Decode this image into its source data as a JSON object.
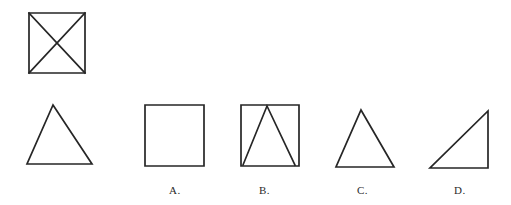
{
  "sheet": {
    "background_color": "#ffffff",
    "ink_color": "#262626",
    "width": 511,
    "height": 205
  },
  "prompt": {
    "figures": [
      {
        "id": "prompt-figure-1",
        "name": "square-with-diagonals",
        "description": "square with both diagonals drawn forming an X",
        "position": {
          "x": 28,
          "y": 12,
          "width": 57,
          "height": 61
        }
      },
      {
        "id": "prompt-figure-2",
        "name": "isosceles-triangle",
        "description": "isosceles triangle, apex at top center",
        "position": {
          "x": 27,
          "y": 105,
          "width": 65,
          "height": 59
        }
      }
    ]
  },
  "options": [
    {
      "key": "A",
      "label": "A.",
      "shape_name": "square",
      "description": "plain square outline",
      "position": {
        "x": 145,
        "y": 105,
        "width": 59,
        "height": 61
      },
      "label_position": {
        "x": 169,
        "y": 185
      }
    },
    {
      "key": "B",
      "label": "B.",
      "shape_name": "square-with-inscribed-triangle",
      "description": "square containing a triangle whose base is the square base and apex at top edge",
      "position": {
        "x": 241,
        "y": 105,
        "width": 58,
        "height": 61
      },
      "label_position": {
        "x": 259,
        "y": 185
      }
    },
    {
      "key": "C",
      "label": "C.",
      "shape_name": "isosceles-triangle",
      "description": "isosceles triangle, apex at top center",
      "position": {
        "x": 336,
        "y": 110,
        "width": 58,
        "height": 57
      },
      "label_position": {
        "x": 357,
        "y": 185
      }
    },
    {
      "key": "D",
      "label": "D.",
      "shape_name": "right-triangle",
      "description": "right triangle with right angle at bottom-right, hypotenuse from bottom-left to top-right",
      "position": {
        "x": 430,
        "y": 111,
        "width": 58,
        "height": 57
      },
      "label_position": {
        "x": 454,
        "y": 185
      }
    }
  ]
}
